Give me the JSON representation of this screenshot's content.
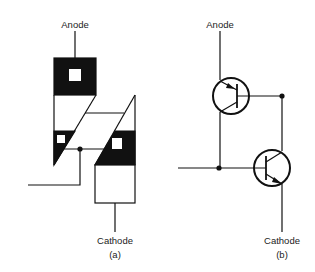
{
  "figure": {
    "panel_a": {
      "anode_label": "Anode",
      "cathode_label": "Cathode",
      "caption": "(a)"
    },
    "panel_b": {
      "anode_label": "Anode",
      "cathode_label": "Cathode",
      "caption": "(b)"
    }
  },
  "colors": {
    "ink": "#111111",
    "background": "#ffffff"
  }
}
